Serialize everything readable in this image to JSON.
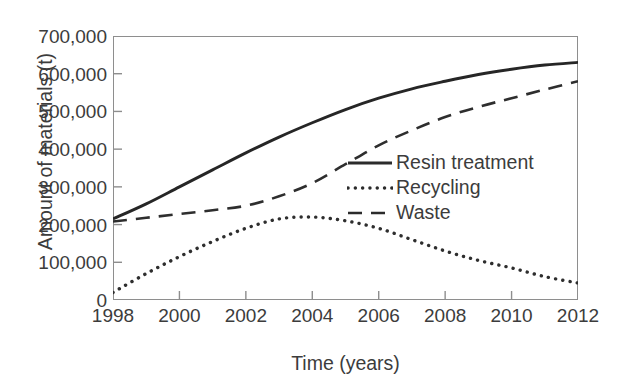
{
  "chart_data": {
    "type": "line",
    "title": "",
    "xlabel": "Time (years)",
    "ylabel": "Amount of materials (t)",
    "xlim": [
      1998,
      2012
    ],
    "ylim": [
      0,
      700000
    ],
    "grid": false,
    "legend_position": "center-right-inside",
    "x_ticks": [
      "1998",
      "2000",
      "2002",
      "2004",
      "2006",
      "2008",
      "2010",
      "2012"
    ],
    "y_ticks": [
      "0",
      "100,000",
      "200,000",
      "300,000",
      "400,000",
      "500,000",
      "600,000",
      "700,000"
    ],
    "x": [
      1998,
      1999,
      2000,
      2001,
      2002,
      2003,
      2004,
      2005,
      2006,
      2007,
      2008,
      2009,
      2010,
      2011,
      2012
    ],
    "series": [
      {
        "name": "Resin treatment",
        "style": "solid",
        "color": "#262626",
        "values": [
          215000,
          255000,
          300000,
          345000,
          390000,
          432000,
          470000,
          505000,
          535000,
          560000,
          580000,
          598000,
          612000,
          623000,
          630000
        ]
      },
      {
        "name": "Recycling",
        "style": "dotted",
        "color": "#2e2e2e",
        "values": [
          20000,
          70000,
          115000,
          155000,
          190000,
          215000,
          220000,
          210000,
          190000,
          160000,
          130000,
          105000,
          85000,
          62000,
          45000
        ]
      },
      {
        "name": "Waste",
        "style": "dashed",
        "color": "#2e2e2e",
        "values": [
          208000,
          218000,
          228000,
          238000,
          250000,
          275000,
          310000,
          360000,
          410000,
          450000,
          485000,
          512000,
          535000,
          558000,
          580000
        ]
      }
    ]
  },
  "legend": {
    "items": [
      {
        "label": "Resin treatment",
        "style": "solid"
      },
      {
        "label": "Recycling",
        "style": "dotted"
      },
      {
        "label": "Waste",
        "style": "dashed"
      }
    ]
  }
}
